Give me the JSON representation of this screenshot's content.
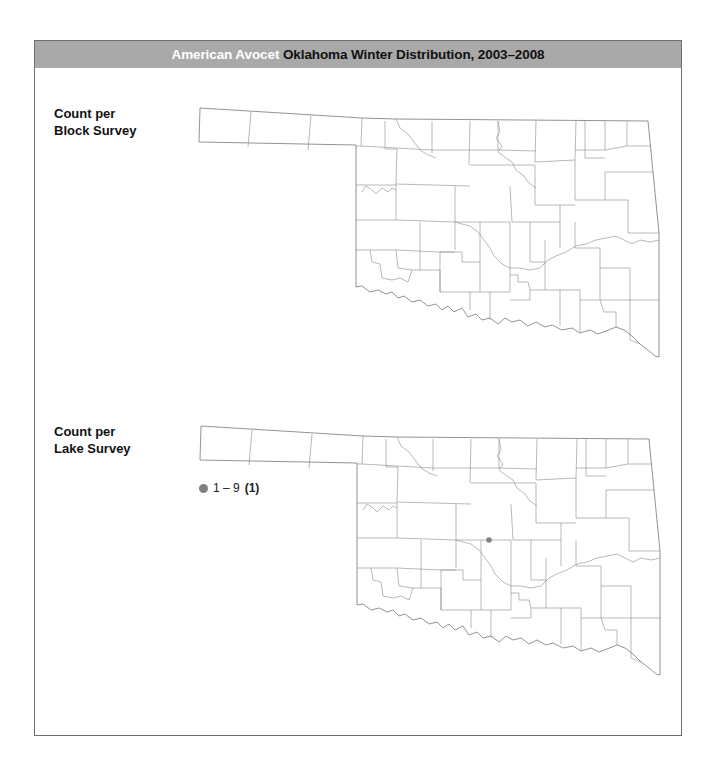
{
  "header": {
    "species": "American Avocet",
    "title": "Oklahoma Winter Distribution, 2003–2008",
    "background_color": "#a9a9a9"
  },
  "panels": [
    {
      "label_line1": "Count per",
      "label_line2": "Block Survey",
      "records": []
    },
    {
      "label_line1": "Count per",
      "label_line2": "Lake Survey",
      "legend": {
        "symbol": "gray-dot",
        "range": "1 – 9",
        "count": "(1)",
        "color": "#808080"
      },
      "records": [
        {
          "x": 489,
          "y": 540,
          "range": "1 – 9"
        }
      ]
    }
  ]
}
